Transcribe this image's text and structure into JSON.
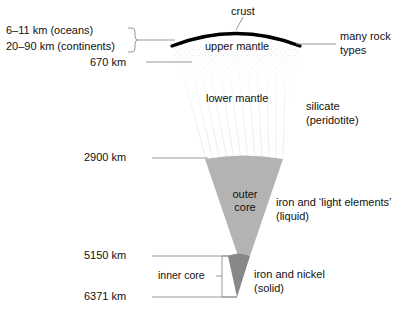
{
  "diagram": {
    "layers": [
      {
        "id": "crust",
        "label": "crust",
        "fill": "#000000"
      },
      {
        "id": "upper-mantle",
        "label": "upper mantle",
        "fill": "#ffffff"
      },
      {
        "id": "lower-mantle",
        "label": "lower mantle",
        "fill": "#fdfdfd"
      },
      {
        "id": "outer-core",
        "label": "outer core",
        "fill": "#b3b3b3"
      },
      {
        "id": "inner-core",
        "label": "inner core",
        "fill": "#878787"
      }
    ],
    "thickness_labels": [
      {
        "id": "oceans",
        "text": "6–11 km (oceans)"
      },
      {
        "id": "continents",
        "text": "20–90 km (continents)"
      }
    ],
    "depths": [
      {
        "id": "d670",
        "text": "670 km"
      },
      {
        "id": "d2900",
        "text": "2900 km"
      },
      {
        "id": "d5150",
        "text": "5150 km"
      },
      {
        "id": "d6371",
        "text": "6371 km"
      }
    ],
    "composition": [
      {
        "id": "crust-comp",
        "line1": "many rock",
        "line2": "types"
      },
      {
        "id": "mantle-comp",
        "line1": "silicate",
        "line2": "(peridotite)"
      },
      {
        "id": "outer-core-comp",
        "line1": "iron and ‘light elements’",
        "line2": "(liquid)"
      },
      {
        "id": "inner-core-comp",
        "line1": "iron and nickel",
        "line2": "(solid)"
      }
    ],
    "core_labels": {
      "outer_line1": "outer",
      "outer_line2": "core",
      "inner": "inner core"
    },
    "colors": {
      "outer_core": "#b3b3b3",
      "inner_core": "#878787",
      "leader": "#8c8c8c",
      "crust": "#000000",
      "text": "#111111"
    }
  }
}
